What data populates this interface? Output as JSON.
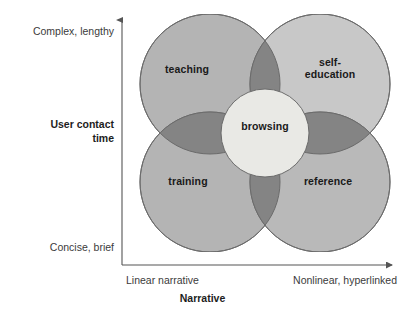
{
  "figure": {
    "type": "venn-quadrant-diagram",
    "axes": {
      "y": {
        "title": "User contact\ntime",
        "top_label": "Complex, lengthy",
        "bottom_label": "Concise, brief"
      },
      "x": {
        "title": "Narrative",
        "left_label": "Linear narrative",
        "right_label": "Nonlinear, hyperlinked"
      }
    },
    "regions": [
      {
        "id": "teaching",
        "label": "teaching",
        "quadrant": "top-left",
        "fill": "#b4b4b4",
        "meaning": "complex/lengthy + linear narrative"
      },
      {
        "id": "self-education",
        "label": "self-\neducation",
        "quadrant": "top-right",
        "fill": "#c8c8c8",
        "meaning": "complex/lengthy + nonlinear, hyperlinked"
      },
      {
        "id": "training",
        "label": "training",
        "quadrant": "bottom-left",
        "fill": "#b4b4b4",
        "meaning": "concise/brief + linear narrative"
      },
      {
        "id": "reference",
        "label": "reference",
        "quadrant": "bottom-right",
        "fill": "#b9b9b9",
        "meaning": "concise/brief + nonlinear, hyperlinked"
      },
      {
        "id": "browsing",
        "label": "browsing",
        "quadrant": "center",
        "fill": "#e9e9e5",
        "meaning": "central overlap of all four modes"
      }
    ],
    "colors": {
      "overlap_dark": "#848484",
      "stroke": "#6b6b6b",
      "axis": "#555555",
      "text": "#1a1a1a",
      "axis_text": "#3b3b3b",
      "background": "#ffffff"
    }
  }
}
